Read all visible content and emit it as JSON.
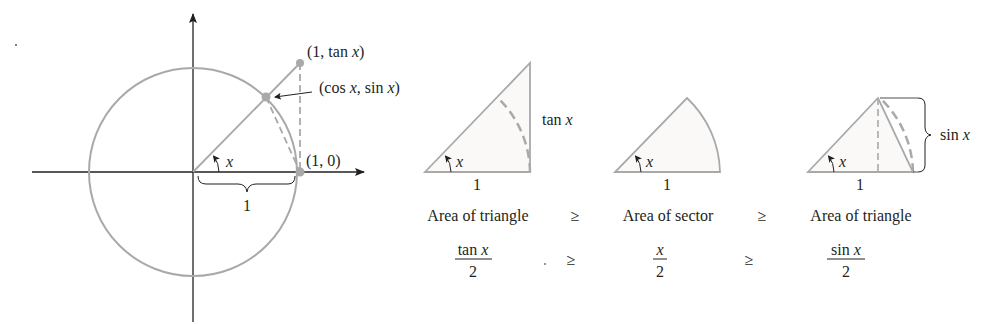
{
  "colors": {
    "shape_stroke": "#a9a9a9",
    "axis": "#231f20",
    "text": "#231f20",
    "fill_tint": "#fbf8f8"
  },
  "unit_circle": {
    "label_tan_point": "(1, tan ",
    "label_tan_point_var": "x",
    "label_tan_point_close": ")",
    "label_cos_sin_open": "(cos ",
    "label_cos_sin_var1": "x",
    "label_cos_sin_mid": ", sin ",
    "label_cos_sin_var2": "x",
    "label_cos_sin_close": ")",
    "label_one_zero": "(1, 0)",
    "angle_label": "x",
    "radius_label": "1"
  },
  "panels": [
    {
      "name": "large-triangle",
      "angle_label": "x",
      "base_label": "1",
      "side_label": "tan x",
      "caption": "Area of triangle",
      "formula_numerator": "tan x",
      "formula_denominator": "2"
    },
    {
      "name": "sector",
      "angle_label": "x",
      "base_label": "1",
      "caption": "Area of sector",
      "formula_numerator": "x",
      "formula_denominator": "2"
    },
    {
      "name": "small-triangle",
      "angle_label": "x",
      "base_label": "1",
      "side_label": "sin x",
      "caption": "Area of triangle",
      "formula_numerator": "sin x",
      "formula_denominator": "2"
    }
  ],
  "relations": [
    "≥",
    "≥"
  ]
}
